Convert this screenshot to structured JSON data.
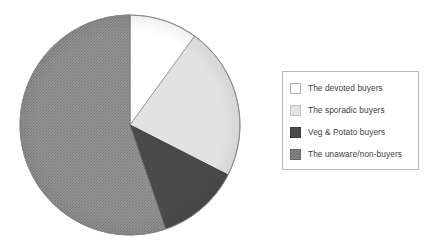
{
  "chart_data": {
    "type": "pie",
    "title": "",
    "subtitle": "",
    "xlabel": "",
    "ylabel": "",
    "grid": false,
    "legend_position": "right",
    "start_angle_deg": 0,
    "direction": "clockwise",
    "categories": [
      "The devoted buyers",
      "The sporadic buyers",
      "Veg & Potato buyers",
      "The unaware/non-buyers"
    ],
    "values": [
      10,
      22.5,
      12,
      55.5
    ],
    "slices": [
      {
        "label": "The devoted buyers",
        "value": 10,
        "start_deg": 0,
        "end_deg": 36,
        "color": "#ffffff",
        "fill": "solid",
        "stroke": "#9a9a9a"
      },
      {
        "label": "The sporadic buyers",
        "value": 22.5,
        "start_deg": 36,
        "end_deg": 117,
        "color": "#e2e2e2",
        "fill": "solid",
        "stroke": "#9a9a9a"
      },
      {
        "label": "Veg & Potato buyers",
        "value": 12,
        "start_deg": 117,
        "end_deg": 161,
        "color": "#4a4a4a",
        "fill": "solid",
        "stroke": "#3a3a3a"
      },
      {
        "label": "The unaware/non-buyers",
        "value": 55.5,
        "start_deg": 161,
        "end_deg": 360,
        "color": "#8e8e8e",
        "fill": "textured",
        "stroke": "#6e6e6e"
      }
    ]
  },
  "legend": {
    "items": [
      {
        "label": "The devoted buyers",
        "swatch_color": "#ffffff",
        "swatch_border": "#b0b0b0",
        "swatch_pattern": "none"
      },
      {
        "label": "The sporadic buyers",
        "swatch_color": "#e4e4e4",
        "swatch_border": "#c2c2c2",
        "swatch_pattern": "none"
      },
      {
        "label": "Veg & Potato buyers",
        "swatch_color": "#4a4a4a",
        "swatch_border": "#3c3c3c",
        "swatch_pattern": "none"
      },
      {
        "label": "The unaware/non-buyers",
        "swatch_color": "#7e7e7e",
        "swatch_border": "#6a6a6a",
        "swatch_pattern": "texture"
      }
    ],
    "border_color": "#b8b8b8",
    "background": "#ffffff"
  },
  "canvas": {
    "background": "#ffffff",
    "pie_center_x": 130,
    "pie_center_y": 125,
    "pie_radius": 110
  }
}
